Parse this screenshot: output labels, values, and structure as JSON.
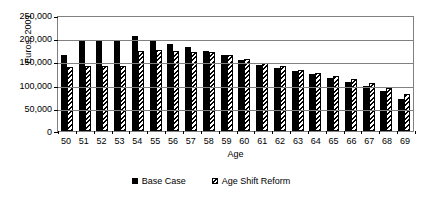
{
  "chart_data": {
    "type": "bar",
    "title": "",
    "xlabel": "Age",
    "ylabel": "Euros, 2001",
    "ylim": [
      0,
      250000
    ],
    "ytick_labels": [
      "250,000",
      "200,000",
      "150,000",
      "100,000",
      "50,000",
      "0"
    ],
    "ytick_values": [
      250000,
      200000,
      150000,
      100000,
      50000,
      0
    ],
    "grid": true,
    "legend_position": "bottom",
    "categories": [
      "50",
      "51",
      "52",
      "53",
      "54",
      "55",
      "56",
      "57",
      "58",
      "59",
      "60",
      "61",
      "62",
      "63",
      "64",
      "65",
      "66",
      "67",
      "68",
      "69"
    ],
    "series": [
      {
        "name": "Base Case",
        "style": "solid-black",
        "values": [
          163000,
          194000,
          194000,
          193000,
          205000,
          196000,
          188000,
          180000,
          172000,
          164000,
          152000,
          143000,
          136000,
          129000,
          122000,
          114000,
          105000,
          98000,
          86000,
          70000
        ]
      },
      {
        "name": "Age Shift Reform",
        "style": "diagonal-hatch",
        "values": [
          138000,
          141000,
          140000,
          140000,
          172000,
          174000,
          172000,
          170000,
          170000,
          164000,
          156000,
          147000,
          140000,
          132000,
          126000,
          118000,
          112000,
          103000,
          93000,
          80000
        ]
      }
    ]
  },
  "legend": {
    "items": [
      {
        "label": "Base Case",
        "style": "solid-black"
      },
      {
        "label": "Age Shift Reform",
        "style": "diagonal-hatch"
      }
    ]
  }
}
